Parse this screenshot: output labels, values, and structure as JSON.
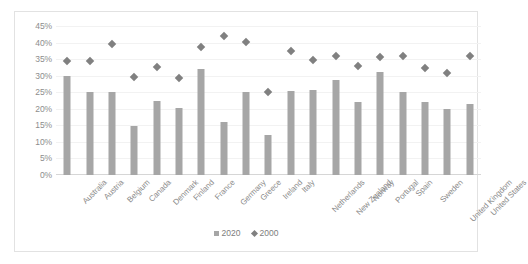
{
  "chart_data": {
    "type": "bar",
    "title": "",
    "xlabel": "",
    "ylabel": "",
    "ylim": [
      0,
      45
    ],
    "ytick_step": 5,
    "ytick_labels": [
      "45%",
      "40%",
      "35%",
      "30%",
      "25%",
      "20%",
      "15%",
      "10%",
      "5%",
      "0%"
    ],
    "grid": true,
    "legend_position": "bottom",
    "categories": [
      "Australia",
      "Austria",
      "Belgium",
      "Canada",
      "Denmark",
      "Finland",
      "France",
      "Germany",
      "Greece",
      "Ireland",
      "Italy",
      "Netherlands",
      "New Zealand",
      "Norway",
      "Portugal",
      "Spain",
      "Sweden",
      "United Kingdom",
      "United States"
    ],
    "series": [
      {
        "name": "2020",
        "type": "bar",
        "color": "#a6a6a6",
        "values": [
          30.0,
          25.0,
          25.2,
          14.8,
          22.3,
          20.3,
          32.0,
          16.0,
          25.0,
          12.0,
          25.5,
          25.7,
          28.8,
          22.2,
          31.2,
          25.2,
          22.0,
          19.8,
          21.5
        ]
      },
      {
        "name": "2000",
        "type": "scatter",
        "marker": "diamond",
        "color": "#808080",
        "values": [
          34.5,
          34.5,
          39.5,
          29.5,
          32.5,
          29.2,
          38.8,
          42.0,
          40.2,
          25.0,
          37.5,
          34.7,
          36.0,
          33.0,
          35.5,
          36.0,
          32.2,
          30.8,
          35.8
        ]
      }
    ]
  },
  "legend": {
    "items": [
      {
        "label": "2020",
        "marker": "square"
      },
      {
        "label": "2000",
        "marker": "diamond"
      }
    ]
  }
}
